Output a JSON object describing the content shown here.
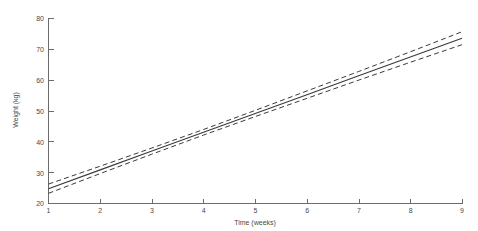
{
  "chart_data": {
    "type": "line",
    "title": "",
    "subtitle": "",
    "xlabel": "Time (weeks)",
    "ylabel": "Weight (kg)",
    "xlim": [
      1,
      9
    ],
    "ylim": [
      20,
      80
    ],
    "xticks": [
      1,
      2,
      3,
      4,
      5,
      6,
      7,
      8,
      9
    ],
    "yticks": [
      20,
      30,
      40,
      50,
      60,
      70,
      80
    ],
    "xticklabels": [
      "1",
      "2",
      "3",
      "4",
      "5",
      "6",
      "7",
      "8",
      "9"
    ],
    "yticklabels": [
      "20",
      "30",
      "40",
      "50",
      "60",
      "70",
      "80"
    ],
    "grid": false,
    "legend": null,
    "legend_position": "none",
    "annotations": [],
    "x": [
      1,
      2,
      3,
      4,
      5,
      6,
      7,
      8,
      9
    ],
    "series": [
      {
        "name": "Fitted regression line",
        "style": "solid",
        "color": "#3a3a3a",
        "values": [
          24.8,
          30.9,
          37.0,
          43.1,
          49.2,
          55.3,
          61.4,
          67.5,
          73.6
        ]
      },
      {
        "name": "Upper confidence limit",
        "style": "dashed",
        "color": "#3a3a3a",
        "values": [
          26.3,
          32.1,
          38.0,
          44.0,
          50.2,
          56.5,
          62.8,
          69.2,
          75.7
        ]
      },
      {
        "name": "Lower confidence limit",
        "style": "dashed",
        "color": "#3a3a3a",
        "values": [
          23.3,
          29.7,
          36.0,
          42.2,
          48.2,
          54.1,
          60.0,
          65.8,
          71.5
        ]
      }
    ]
  },
  "axes": {
    "x_title": "Time (weeks)",
    "y_title": "Weight (kg)"
  },
  "ticks": {
    "x": [
      "1",
      "2",
      "3",
      "4",
      "5",
      "6",
      "7",
      "8",
      "9"
    ],
    "y": [
      "20",
      "30",
      "40",
      "50",
      "60",
      "70",
      "80"
    ]
  },
  "colors": {
    "axis": "#6b6b6b",
    "line": "#3a3a3a",
    "band": "#3a3a3a",
    "text": "#4a4a4a",
    "background": "#ffffff"
  }
}
